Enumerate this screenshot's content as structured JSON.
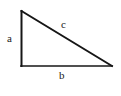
{
  "figure": {
    "name": "right-triangle-diagram",
    "background_color": "#ffffff",
    "stroke_color": "#161616",
    "label_color": "#1a1a1a",
    "width": 121,
    "height": 96
  },
  "triangle": {
    "vertices": {
      "top": {
        "x": 21,
        "y": 11
      },
      "bottom_left": {
        "x": 21,
        "y": 66
      },
      "bottom_right": {
        "x": 112,
        "y": 66
      }
    },
    "right_angle_at": "bottom_left",
    "sides": [
      {
        "id": "a",
        "label": "a",
        "role": "vertical-leg",
        "from": "top",
        "to": "bottom_left",
        "label_position": {
          "x": 11,
          "y": 38
        },
        "stroke_width": 2
      },
      {
        "id": "b",
        "label": "b",
        "role": "horizontal-leg",
        "from": "bottom_left",
        "to": "bottom_right",
        "label_position": {
          "x": 63,
          "y": 76
        },
        "stroke_width": 1.6
      },
      {
        "id": "c",
        "label": "c",
        "role": "hypotenuse",
        "from": "top",
        "to": "bottom_right",
        "label_position": {
          "x": 65,
          "y": 25
        },
        "stroke_width": 2
      }
    ]
  }
}
